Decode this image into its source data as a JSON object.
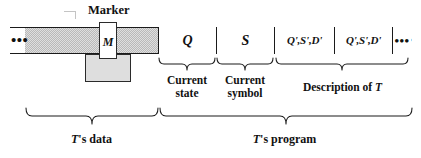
{
  "figure": {
    "name": "turing-machine-tape-diagram",
    "marker_label": "Marker",
    "ellipsis_left": "•••",
    "ellipsis_right": "•••",
    "colors": {
      "tape_outline": "#1a1a1a",
      "data_shade": "#b9b9b9",
      "head_block": "#dedede",
      "head_outline": "#2b2b2b",
      "text": "#111111",
      "background": "#ffffff"
    }
  },
  "tape": {
    "marker_cell": {
      "label": "M"
    },
    "cells": [
      {
        "id": "current-state",
        "label": "Q"
      },
      {
        "id": "current-symbol",
        "label": "S"
      },
      {
        "id": "transition-1",
        "label": "Q',S',D'"
      },
      {
        "id": "transition-2",
        "label": "Q',S',D'"
      },
      {
        "id": "more",
        "label": "•••"
      }
    ]
  },
  "annotations": {
    "current_state": {
      "line1": "Current",
      "line2": "state"
    },
    "current_symbol": {
      "line1": "Current",
      "line2": "symbol"
    },
    "description": {
      "prefix": "Description  of ",
      "subject": "T"
    },
    "t_data": {
      "subject": "T",
      "suffix": "'s data"
    },
    "t_program": {
      "subject": "T",
      "suffix": "'s program"
    }
  }
}
